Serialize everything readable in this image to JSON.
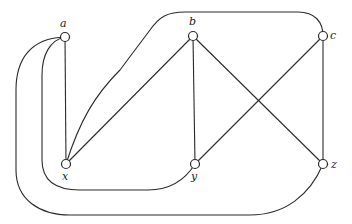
{
  "diagram": {
    "type": "graph",
    "colors": {
      "stroke": "#2a2a2a",
      "node_fill": "#ffffff",
      "background": "#ffffff"
    },
    "nodes": [
      {
        "id": "a",
        "label": "a",
        "x": 65,
        "y": 37,
        "label_x": 60,
        "label_y": 27
      },
      {
        "id": "b",
        "label": "b",
        "x": 193,
        "y": 36,
        "label_x": 189,
        "label_y": 25
      },
      {
        "id": "c",
        "label": "c",
        "x": 323,
        "y": 36,
        "label_x": 330,
        "label_y": 39
      },
      {
        "id": "x",
        "label": "x",
        "x": 66,
        "y": 164,
        "label_x": 62,
        "label_y": 180
      },
      {
        "id": "y",
        "label": "y",
        "x": 195,
        "y": 164,
        "label_x": 191,
        "label_y": 180
      },
      {
        "id": "z",
        "label": "z",
        "x": 323,
        "y": 164,
        "label_x": 331,
        "label_y": 168
      }
    ],
    "edges": [
      {
        "from": "a",
        "to": "x",
        "shape": "straight"
      },
      {
        "from": "b",
        "to": "x",
        "shape": "straight"
      },
      {
        "from": "b",
        "to": "y",
        "shape": "straight"
      },
      {
        "from": "b",
        "to": "z",
        "shape": "straight"
      },
      {
        "from": "c",
        "to": "y",
        "shape": "straight"
      },
      {
        "from": "c",
        "to": "z",
        "shape": "straight"
      },
      {
        "from": "x",
        "to": "c",
        "shape": "curved-over-top"
      },
      {
        "from": "a",
        "to": "y",
        "shape": "curved-inner-loop"
      },
      {
        "from": "a",
        "to": "z",
        "shape": "curved-outer-loop"
      }
    ]
  }
}
